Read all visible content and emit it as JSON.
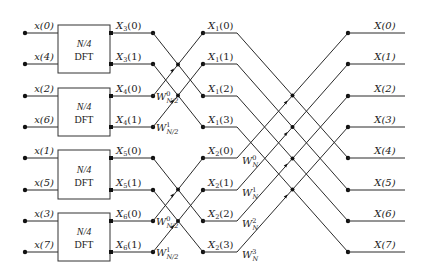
{
  "diagram": {
    "rows_y": [
      33,
      64,
      96,
      127,
      158,
      190,
      221,
      252
    ],
    "inputs": [
      "x(0)",
      "x(4)",
      "x(2)",
      "x(6)",
      "x(1)",
      "x(5)",
      "x(3)",
      "x(7)"
    ],
    "blocks": [
      {
        "label_top": "N/4",
        "label_bottom": "DFT"
      },
      {
        "label_top": "N/4",
        "label_bottom": "DFT"
      },
      {
        "label_top": "N/4",
        "label_bottom": "DFT"
      },
      {
        "label_top": "N/4",
        "label_bottom": "DFT"
      }
    ],
    "stage1_outputs": [
      {
        "base": "X",
        "sub": "3",
        "arg": "(0)"
      },
      {
        "base": "X",
        "sub": "3",
        "arg": "(1)"
      },
      {
        "base": "X",
        "sub": "4",
        "arg": "(0)"
      },
      {
        "base": "X",
        "sub": "4",
        "arg": "(1)"
      },
      {
        "base": "X",
        "sub": "5",
        "arg": "(0)"
      },
      {
        "base": "X",
        "sub": "5",
        "arg": "(1)"
      },
      {
        "base": "X",
        "sub": "6",
        "arg": "(0)"
      },
      {
        "base": "X",
        "sub": "6",
        "arg": "(1)"
      }
    ],
    "stage1_twiddles": [
      {
        "row": 2,
        "base": "W",
        "sup": "0",
        "sub": "N/2"
      },
      {
        "row": 3,
        "base": "W",
        "sup": "1",
        "sub": "N/2"
      },
      {
        "row": 6,
        "base": "W",
        "sup": "0",
        "sub": "N/2"
      },
      {
        "row": 7,
        "base": "W",
        "sup": "1",
        "sub": "N/2"
      }
    ],
    "stage2_outputs": [
      {
        "base": "X",
        "sub": "1",
        "arg": "(0)"
      },
      {
        "base": "X",
        "sub": "1",
        "arg": "(1)"
      },
      {
        "base": "X",
        "sub": "1",
        "arg": "(2)"
      },
      {
        "base": "X",
        "sub": "1",
        "arg": "(3)"
      },
      {
        "base": "X",
        "sub": "2",
        "arg": "(0)"
      },
      {
        "base": "X",
        "sub": "2",
        "arg": "(1)"
      },
      {
        "base": "X",
        "sub": "2",
        "arg": "(2)"
      },
      {
        "base": "X",
        "sub": "2",
        "arg": "(3)"
      }
    ],
    "stage2_twiddles": [
      {
        "row": 4,
        "base": "W",
        "sup": "0",
        "sub": "N"
      },
      {
        "row": 5,
        "base": "W",
        "sup": "1",
        "sub": "N"
      },
      {
        "row": 6,
        "base": "W",
        "sup": "2",
        "sub": "N"
      },
      {
        "row": 7,
        "base": "W",
        "sup": "3",
        "sub": "N"
      }
    ],
    "outputs": [
      "X(0)",
      "X(1)",
      "X(2)",
      "X(3)",
      "X(4)",
      "X(5)",
      "X(6)",
      "X(7)"
    ]
  }
}
